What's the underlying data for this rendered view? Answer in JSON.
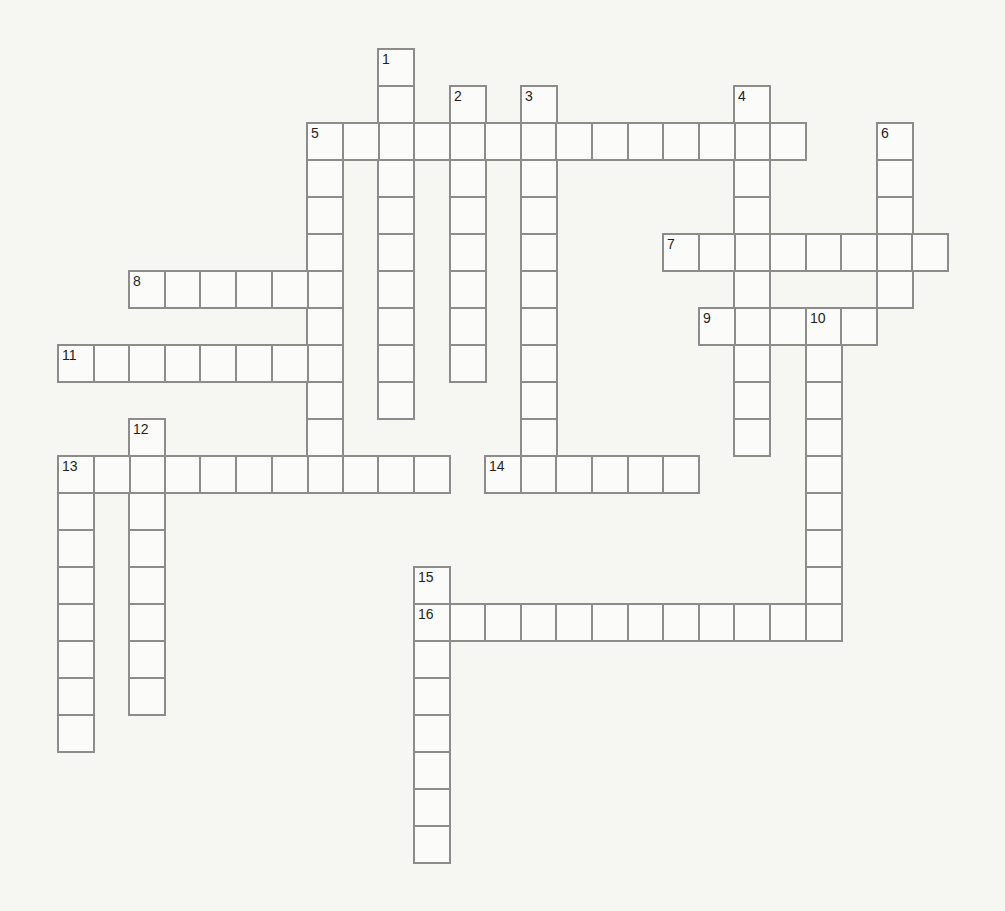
{
  "puzzle": {
    "type": "crossword",
    "grid": {
      "origin_x": 57,
      "origin_y": 48,
      "cell_w": 35.6,
      "cell_h": 37
    },
    "colors": {
      "background": "#f6f6f3",
      "cell_fill": "#fbfbf9",
      "cell_border": "#8c8c8c",
      "number": "#1f1f1f"
    },
    "entries": [
      {
        "number": "1",
        "direction": "down",
        "row": 0,
        "col": 9,
        "length": 10
      },
      {
        "number": "2",
        "direction": "down",
        "row": 1,
        "col": 11,
        "length": 8
      },
      {
        "number": "3",
        "direction": "down",
        "row": 1,
        "col": 13,
        "length": 11
      },
      {
        "number": "4",
        "direction": "down",
        "row": 1,
        "col": 19,
        "length": 10
      },
      {
        "number": "5",
        "direction": "across",
        "row": 2,
        "col": 7,
        "length": 14
      },
      {
        "number": "5",
        "direction": "down",
        "row": 2,
        "col": 7,
        "length": 10
      },
      {
        "number": "6",
        "direction": "down",
        "row": 2,
        "col": 23,
        "length": 5
      },
      {
        "number": "7",
        "direction": "across",
        "row": 5,
        "col": 17,
        "length": 8
      },
      {
        "number": "8",
        "direction": "across",
        "row": 6,
        "col": 2,
        "length": 6
      },
      {
        "number": "9",
        "direction": "across",
        "row": 7,
        "col": 18,
        "length": 5
      },
      {
        "number": "10",
        "direction": "down",
        "row": 7,
        "col": 21,
        "length": 9
      },
      {
        "number": "11",
        "direction": "across",
        "row": 8,
        "col": 0,
        "length": 8
      },
      {
        "number": "12",
        "direction": "down",
        "row": 10,
        "col": 2,
        "length": 8
      },
      {
        "number": "13",
        "direction": "across",
        "row": 11,
        "col": 0,
        "length": 11
      },
      {
        "number": "13",
        "direction": "down",
        "row": 11,
        "col": 0,
        "length": 8
      },
      {
        "number": "14",
        "direction": "across",
        "row": 11,
        "col": 12,
        "length": 6
      },
      {
        "number": "15",
        "direction": "down",
        "row": 14,
        "col": 10,
        "length": 8
      },
      {
        "number": "16",
        "direction": "across",
        "row": 15,
        "col": 10,
        "length": 12
      }
    ]
  }
}
